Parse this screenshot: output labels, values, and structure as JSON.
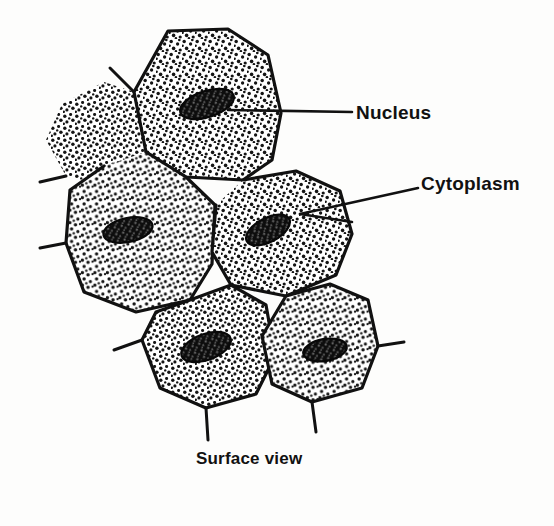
{
  "figure": {
    "caption": "Surface view",
    "background_color": "#fdfdfc",
    "ink_color": "#111111",
    "style": "hand-drawn line illustration with stippled shading",
    "labels": [
      {
        "id": "nucleus",
        "text": "Nucleus",
        "leader": "straight horizontal line from label left edge to the nucleus of the top cell"
      },
      {
        "id": "cytoplasm",
        "text": "Cytoplasm",
        "leader": "narrow V of two lines from label left edge into the middle-right cell cytoplasm"
      }
    ],
    "cells": [
      {
        "id": "cell-top",
        "position": "top-center",
        "nucleus": {
          "present": true,
          "shape": "oval",
          "tilt_deg": -18
        }
      },
      {
        "id": "cell-upper-left-partial",
        "position": "upper-left, partially drawn, stipple only",
        "nucleus": {
          "present": false
        }
      },
      {
        "id": "cell-middle-left",
        "position": "middle-left",
        "nucleus": {
          "present": true,
          "shape": "oval",
          "tilt_deg": -12
        }
      },
      {
        "id": "cell-middle-right",
        "position": "middle-right",
        "nucleus": {
          "present": true,
          "shape": "oval",
          "tilt_deg": -28
        }
      },
      {
        "id": "cell-bottom-left",
        "position": "bottom-left",
        "nucleus": {
          "present": true,
          "shape": "oval",
          "tilt_deg": -20
        }
      },
      {
        "id": "cell-bottom-right",
        "position": "bottom-right",
        "nucleus": {
          "present": true,
          "shape": "oval",
          "tilt_deg": -10
        }
      }
    ],
    "features": {
      "cytoplasm_texture": "dense stipple of small dots",
      "nucleus_texture": "dark filled oval with light speckles",
      "wall_stubs": "short line segments projecting outward from several cell vertices"
    }
  }
}
